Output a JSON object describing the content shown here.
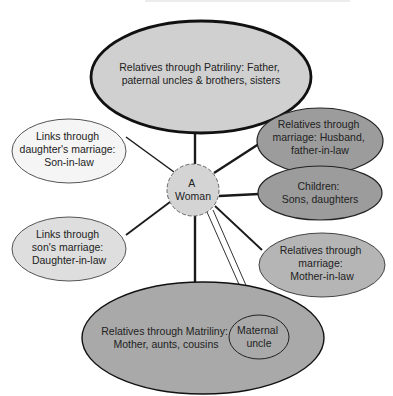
{
  "diagram": {
    "title": "",
    "center_node": {
      "id": "woman",
      "lines": [
        "A",
        "Woman"
      ],
      "fill": "#d4d4d4",
      "border": "dashed"
    },
    "nodes": [
      {
        "id": "patriliny",
        "lines": [
          "Relatives through Patriliny: Father,",
          "paternal uncles & brothers, sisters"
        ],
        "fill": "#cfcfcf",
        "border_weight": "thick"
      },
      {
        "id": "daughters-marriage",
        "lines": [
          "Links through",
          "daughter's marriage:",
          "Son-in-law"
        ],
        "fill": "#f4f4f4"
      },
      {
        "id": "sons-marriage",
        "lines": [
          "Links through",
          "son's marriage:",
          "Daughter-in-law"
        ],
        "fill": "#e0e0e0"
      },
      {
        "id": "husband",
        "lines": [
          "Relatives through",
          "marriage: Husband,",
          "father-in-law"
        ],
        "fill": "#9a9a9a"
      },
      {
        "id": "children",
        "lines": [
          "Children:",
          "Sons, daughters"
        ],
        "fill": "#9a9a9a"
      },
      {
        "id": "mother-in-law",
        "lines": [
          "Relatives through",
          "marriage:",
          "Mother-in-law"
        ],
        "fill": "#b4b4b4"
      },
      {
        "id": "matriliny",
        "lines": [
          "Relatives through Matriliny:",
          "Mother, aunts, cousins"
        ],
        "fill": "#a8a8a8"
      },
      {
        "id": "maternal-uncle",
        "lines": [
          "Maternal",
          "uncle"
        ],
        "fill": "#a8a8a8"
      }
    ],
    "edges": [
      {
        "from": "woman",
        "to": "patriliny",
        "style": "solid-thick"
      },
      {
        "from": "woman",
        "to": "daughters-marriage",
        "style": "solid"
      },
      {
        "from": "woman",
        "to": "sons-marriage",
        "style": "solid"
      },
      {
        "from": "woman",
        "to": "husband",
        "style": "solid-thick"
      },
      {
        "from": "woman",
        "to": "children",
        "style": "solid-thick"
      },
      {
        "from": "woman",
        "to": "mother-in-law",
        "style": "solid"
      },
      {
        "from": "woman",
        "to": "matriliny",
        "style": "solid-thick"
      },
      {
        "from": "woman",
        "to": "maternal-uncle",
        "style": "double"
      }
    ]
  }
}
